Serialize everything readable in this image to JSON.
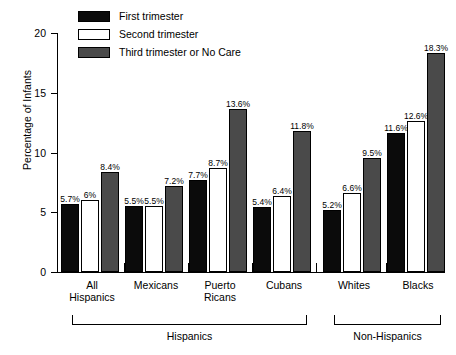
{
  "chart_data": {
    "type": "bar",
    "title": "",
    "xlabel": "",
    "ylabel": "Percentage of Infants",
    "ylim": [
      0,
      20
    ],
    "yticks": [
      "0",
      "5",
      "10",
      "15",
      "20"
    ],
    "grid": false,
    "legend_position": "top-left",
    "categories": [
      "All Hispanics",
      "Mexicans",
      "Puerto Ricans",
      "Cubans",
      "Whites",
      "Blacks"
    ],
    "category_lines": [
      [
        "All",
        "Hispanics"
      ],
      [
        "Mexicans"
      ],
      [
        "Puerto",
        "Ricans"
      ],
      [
        "Cubans"
      ],
      [
        "Whites"
      ],
      [
        "Blacks"
      ]
    ],
    "series": [
      {
        "name": "First trimester",
        "color": "#0b0b0b",
        "values": [
          5.7,
          5.5,
          7.7,
          5.4,
          5.2,
          11.6
        ],
        "labels": [
          "5.7%",
          "5.5%",
          "7.7%",
          "5.4%",
          "5.2%",
          "11.6%"
        ]
      },
      {
        "name": "Second trimester",
        "color": "#ffffff",
        "values": [
          6.0,
          5.5,
          8.7,
          6.4,
          6.6,
          12.6
        ],
        "labels": [
          "6%",
          "5.5%",
          "8.7%",
          "6.4%",
          "6.6%",
          "12.6%"
        ]
      },
      {
        "name": "Third trimester or No Care",
        "color": "#4a4a4a",
        "values": [
          8.4,
          7.2,
          13.6,
          11.8,
          9.5,
          18.3
        ],
        "labels": [
          "8.4%",
          "7.2%",
          "13.6%",
          "11.8%",
          "9.5%",
          "18.3%"
        ]
      }
    ],
    "brackets": [
      {
        "label": "Hispanics",
        "from": 0,
        "to": 3
      },
      {
        "label": "Non-Hispanics",
        "from": 4,
        "to": 5
      }
    ]
  }
}
